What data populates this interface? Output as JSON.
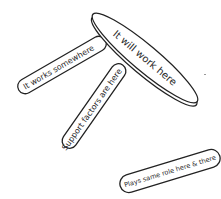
{
  "diagram": {
    "type": "stool metaphor",
    "seat": {
      "label": "It will work here",
      "shape": "ellipse"
    },
    "legs": [
      {
        "label": "It works somewhere"
      },
      {
        "label": "Support factors are here"
      }
    ],
    "note": {
      "label": "Plays same role here & there",
      "shape": "pill"
    },
    "colors": {
      "stroke": "#222222",
      "fill": "#ffffff",
      "text": "#2a2a2a"
    }
  }
}
